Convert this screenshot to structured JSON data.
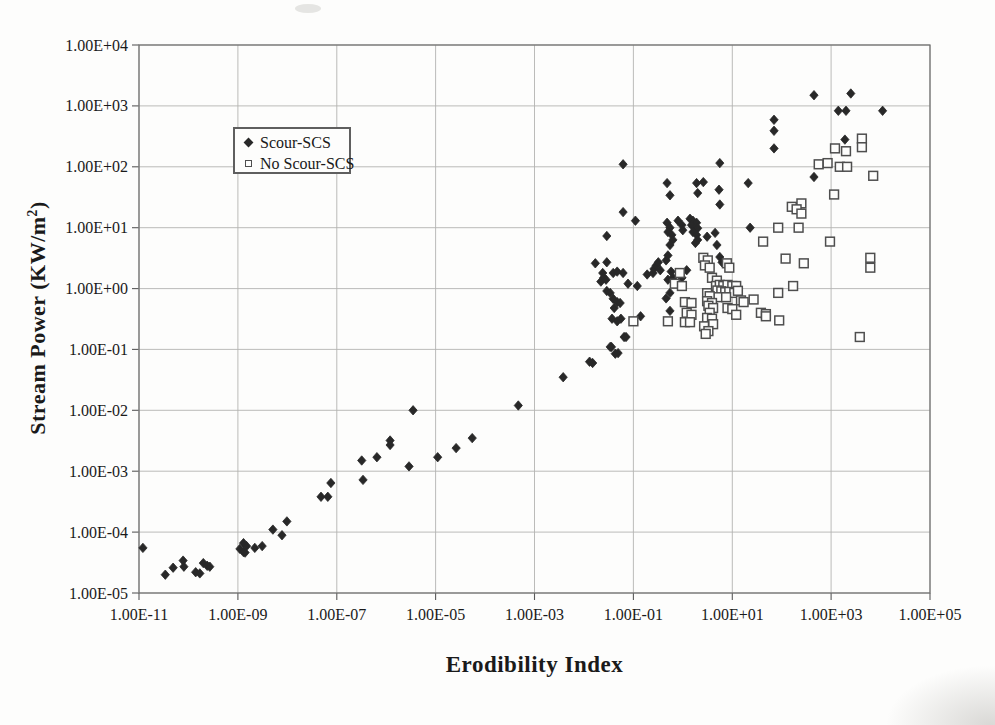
{
  "chart_data": {
    "type": "scatter",
    "x_axis": {
      "label": "Erodibility Index",
      "scale": "log",
      "log_range": [
        -11,
        5
      ],
      "ticks": [
        {
          "label": "1.00E-11",
          "log": -11
        },
        {
          "label": "1.00E-09",
          "log": -9
        },
        {
          "label": "1.00E-07",
          "log": -7
        },
        {
          "label": "1.00E-05",
          "log": -5
        },
        {
          "label": "1.00E-03",
          "log": -3
        },
        {
          "label": "1.00E-01",
          "log": -1
        },
        {
          "label": "1.00E+01",
          "log": 1
        },
        {
          "label": "1.00E+03",
          "log": 3
        },
        {
          "label": "1.00E+05",
          "log": 5
        }
      ]
    },
    "y_axis": {
      "label_prefix": "Stream Power (KW/m",
      "label_sup": "2",
      "label_suffix": ")",
      "scale": "log",
      "log_range": [
        -5,
        4
      ],
      "ticks": [
        {
          "label": "1.00E+04",
          "log": 4
        },
        {
          "label": "1.00E+03",
          "log": 3
        },
        {
          "label": "1.00E+02",
          "log": 2
        },
        {
          "label": "1.00E+01",
          "log": 1
        },
        {
          "label": "1.00E+00",
          "log": 0
        },
        {
          "label": "1.00E-01",
          "log": -1
        },
        {
          "label": "1.00E-02",
          "log": -2
        },
        {
          "label": "1.00E-03",
          "log": -3
        },
        {
          "label": "1.00E-04",
          "log": -4
        },
        {
          "label": "1.00E-05",
          "log": -5
        }
      ]
    },
    "legend": {
      "position": "inside-top-left"
    },
    "colors": {
      "marker_dark": "#282828",
      "square_stroke": "#4e4e4e",
      "grid": "#b3b3b1",
      "border": "#6e6e6e",
      "text": "#1a1a1a"
    },
    "series": [
      {
        "name": "Scour-SCS",
        "marker": "filled-diamond",
        "color": "#282828",
        "points": [
          [
            1.2e-11,
            5.5e-05
          ],
          [
            3.4e-11,
            2e-05
          ],
          [
            4.9e-11,
            2.6e-05
          ],
          [
            7.8e-11,
            3.4e-05
          ],
          [
            8.1e-11,
            2.7e-05
          ],
          [
            1.4e-10,
            2.2e-05
          ],
          [
            1.7e-10,
            2.1e-05
          ],
          [
            2e-10,
            3.1e-05
          ],
          [
            2.4e-10,
            2.8e-05
          ],
          [
            2.7e-10,
            2.7e-05
          ],
          [
            1.1e-09,
            5.3e-05
          ],
          [
            1.3e-09,
            4.7e-05
          ],
          [
            1.4e-09,
            4.6e-05
          ],
          [
            1.3e-09,
            6.6e-05
          ],
          [
            1.5e-09,
            5.9e-05
          ],
          [
            2.2e-09,
            5.5e-05
          ],
          [
            3.1e-09,
            5.9e-05
          ],
          [
            5.1e-09,
            0.00011
          ],
          [
            7.8e-09,
            8.9e-05
          ],
          [
            9.8e-09,
            0.00015
          ],
          [
            4.8e-08,
            0.00038
          ],
          [
            6.6e-08,
            0.00038
          ],
          [
            7.6e-08,
            0.00064
          ],
          [
            3.2e-07,
            0.0015
          ],
          [
            3.4e-07,
            0.00072
          ],
          [
            6.5e-07,
            0.0017
          ],
          [
            1.2e-06,
            0.0032
          ],
          [
            1.2e-06,
            0.0027
          ],
          [
            2.9e-06,
            0.0012
          ],
          [
            3.5e-06,
            0.01
          ],
          [
            1.1e-05,
            0.0017
          ],
          [
            2.6e-05,
            0.0024
          ],
          [
            5.5e-05,
            0.0035
          ],
          [
            0.00047,
            0.012
          ],
          [
            0.0038,
            0.035
          ],
          [
            0.015,
            0.06
          ],
          [
            0.036,
            0.11
          ],
          [
            0.049,
            0.087
          ],
          [
            0.065,
            0.16
          ],
          [
            0.062,
            110
          ],
          [
            5.6,
            115
          ],
          [
            0.48,
            54
          ],
          [
            1.9,
            54
          ],
          [
            2.6,
            56
          ],
          [
            0.55,
            34
          ],
          [
            2.0,
            37
          ],
          [
            5.4,
            42
          ],
          [
            5.6,
            24
          ],
          [
            21,
            54
          ],
          [
            23,
            10
          ],
          [
            0.062,
            18
          ],
          [
            0.11,
            13
          ],
          [
            0.029,
            7.3
          ],
          [
            0.48,
            12
          ],
          [
            0.55,
            10
          ],
          [
            0.5,
            8.5
          ],
          [
            0.6,
            7.6
          ],
          [
            0.63,
            6.3
          ],
          [
            0.55,
            5.2
          ],
          [
            0.8,
            13
          ],
          [
            0.96,
            11
          ],
          [
            1.0,
            9.1
          ],
          [
            1.4,
            14
          ],
          [
            1.6,
            13
          ],
          [
            1.9,
            12
          ],
          [
            1.5,
            11
          ],
          [
            1.8,
            10
          ],
          [
            2.0,
            9.8
          ],
          [
            1.6,
            8.5
          ],
          [
            1.9,
            7.6
          ],
          [
            2.0,
            6.3
          ],
          [
            1.8,
            5.6
          ],
          [
            3.1,
            7.1
          ],
          [
            4.5,
            8.2
          ],
          [
            4.9,
            5.2
          ],
          [
            5.6,
            3.3
          ],
          [
            6.2,
            2.7
          ],
          [
            0.017,
            2.6
          ],
          [
            0.029,
            2.7
          ],
          [
            0.024,
            1.8
          ],
          [
            0.025,
            1.5
          ],
          [
            0.022,
            1.3
          ],
          [
            0.028,
            1.4
          ],
          [
            0.039,
            1.8
          ],
          [
            0.047,
            1.9
          ],
          [
            0.062,
            1.8
          ],
          [
            0.078,
            1.2
          ],
          [
            0.12,
            1.1
          ],
          [
            0.19,
            1.7
          ],
          [
            0.25,
            1.8
          ],
          [
            0.26,
            2.1
          ],
          [
            0.29,
            2.4
          ],
          [
            0.32,
            2.7
          ],
          [
            0.35,
            2.0
          ],
          [
            0.46,
            2.9
          ],
          [
            0.5,
            3.5
          ],
          [
            0.5,
            1.4
          ],
          [
            0.58,
            1.9
          ],
          [
            0.63,
            1.5
          ],
          [
            1.2,
            2.0
          ],
          [
            0.96,
            1.5
          ],
          [
            0.46,
            0.69
          ],
          [
            0.029,
            0.91
          ],
          [
            0.034,
            0.85
          ],
          [
            0.039,
            0.68
          ],
          [
            0.047,
            0.6
          ],
          [
            0.054,
            0.58
          ],
          [
            0.041,
            0.48
          ],
          [
            0.037,
            0.32
          ],
          [
            0.047,
            0.29
          ],
          [
            0.056,
            0.32
          ],
          [
            0.071,
            0.16
          ],
          [
            0.034,
            0.11
          ],
          [
            0.043,
            0.085
          ],
          [
            0.013,
            0.063
          ],
          [
            0.14,
            0.35
          ],
          [
            0.55,
            0.85
          ],
          [
            0.55,
            0.43
          ],
          [
            450,
            1500
          ],
          [
            2500,
            1600
          ],
          [
            1400,
            830
          ],
          [
            2000,
            830
          ],
          [
            11000,
            830
          ],
          [
            70,
            590
          ],
          [
            70,
            390
          ],
          [
            70,
            200
          ],
          [
            1900,
            280
          ],
          [
            450,
            68
          ]
        ]
      },
      {
        "name": "No Scour-SCS",
        "marker": "open-square",
        "color": "#4e4e4e",
        "points": [
          [
            0.1,
            0.29
          ],
          [
            0.5,
            0.29
          ],
          [
            0.87,
            1.8
          ],
          [
            0.69,
            1.2
          ],
          [
            0.96,
            1.1
          ],
          [
            1.1,
            0.6
          ],
          [
            1.5,
            0.58
          ],
          [
            1.2,
            0.4
          ],
          [
            1.5,
            0.37
          ],
          [
            1.1,
            0.28
          ],
          [
            1.4,
            0.28
          ],
          [
            2.6,
            3.2
          ],
          [
            3.2,
            2.9
          ],
          [
            2.8,
            2.4
          ],
          [
            3.5,
            2.2
          ],
          [
            7.8,
            2.6
          ],
          [
            8.7,
            2.2
          ],
          [
            3.9,
            1.5
          ],
          [
            4.9,
            1.35
          ],
          [
            4.7,
            1.1
          ],
          [
            5.6,
            1.15
          ],
          [
            6.6,
            1.1
          ],
          [
            8.0,
            1.15
          ],
          [
            10,
            1.1
          ],
          [
            12,
            1.1
          ],
          [
            5.0,
            0.93
          ],
          [
            6.0,
            0.9
          ],
          [
            7.2,
            0.87
          ],
          [
            8.7,
            0.88
          ],
          [
            11,
            0.85
          ],
          [
            13,
            0.92
          ],
          [
            5.2,
            0.72
          ],
          [
            7.5,
            0.72
          ],
          [
            3.1,
            0.84
          ],
          [
            3.5,
            0.75
          ],
          [
            3.1,
            0.62
          ],
          [
            3.9,
            0.58
          ],
          [
            3.3,
            0.52
          ],
          [
            4.1,
            0.48
          ],
          [
            3.5,
            0.4
          ],
          [
            3.1,
            0.33
          ],
          [
            3.9,
            0.32
          ],
          [
            4.1,
            0.26
          ],
          [
            2.7,
            0.24
          ],
          [
            3.3,
            0.2
          ],
          [
            2.9,
            0.18
          ],
          [
            15,
            0.64
          ],
          [
            17,
            0.6
          ],
          [
            27,
            0.66
          ],
          [
            8.0,
            0.48
          ],
          [
            10,
            0.46
          ],
          [
            12,
            0.37
          ],
          [
            38,
            0.4
          ],
          [
            48,
            0.38
          ],
          [
            160,
            22
          ],
          [
            250,
            25
          ],
          [
            200,
            20
          ],
          [
            250,
            17
          ],
          [
            85,
            10
          ],
          [
            220,
            10
          ],
          [
            42,
            5.9
          ],
          [
            950,
            5.9
          ],
          [
            120,
            3.1
          ],
          [
            280,
            2.6
          ],
          [
            6200,
            3.2
          ],
          [
            6200,
            2.2
          ],
          [
            170,
            1.1
          ],
          [
            85,
            0.85
          ],
          [
            48,
            0.35
          ],
          [
            89,
            0.3
          ],
          [
            3800,
            0.16
          ],
          [
            1200,
            200
          ],
          [
            2000,
            180
          ],
          [
            560,
            110
          ],
          [
            850,
            115
          ],
          [
            1500,
            100
          ],
          [
            2100,
            100
          ],
          [
            7100,
            71
          ],
          [
            1150,
            35
          ],
          [
            4200,
            290
          ],
          [
            4200,
            210
          ]
        ]
      }
    ]
  }
}
